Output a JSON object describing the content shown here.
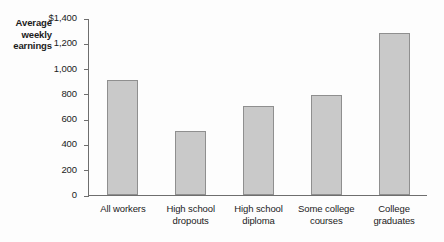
{
  "chart_data": {
    "type": "bar",
    "title": "",
    "xlabel": "",
    "ylabel": "Average weekly earnings",
    "ylabel_lines": [
      "Average",
      "weekly",
      "earnings"
    ],
    "categories": [
      "All workers",
      "High school dropouts",
      "High school diploma",
      "Some college courses",
      "College graduates"
    ],
    "category_lines": [
      [
        "All workers"
      ],
      [
        "High school",
        "dropouts"
      ],
      [
        "High school",
        "diploma"
      ],
      [
        "Some college",
        "courses"
      ],
      [
        "College",
        "graduates"
      ]
    ],
    "values": [
      910,
      505,
      705,
      795,
      1285
    ],
    "ylim": [
      0,
      1400
    ],
    "ytick_values": [
      1400,
      1200,
      1000,
      800,
      600,
      400,
      200,
      0
    ],
    "ytick_labels": [
      "$1,400",
      "1,200",
      "1,000",
      "800",
      "600",
      "400",
      "200",
      "0"
    ],
    "grid": false,
    "legend": "none",
    "currency_symbol": "$",
    "bar_fill_color": "#c9c9c9",
    "bar_edge_color": "#8f8f8f",
    "axis_color": "#6e6e6e",
    "background_color": "#fdfdfd"
  }
}
